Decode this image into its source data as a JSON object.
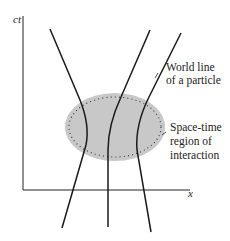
{
  "diagram": {
    "axes": {
      "vertical_label": "ct",
      "horizontal_label": "x"
    },
    "annotations": {
      "world_line": [
        "World line",
        "of a particle"
      ],
      "region": [
        "Space-time",
        "region of",
        "interaction"
      ]
    },
    "colors": {
      "line": "#1a1a1a",
      "region_fill": "#c8c8c8",
      "background": "#ffffff"
    },
    "elements": {
      "world_lines_count": 3,
      "interaction_region": "shaded ellipse with dashed tick border"
    }
  }
}
